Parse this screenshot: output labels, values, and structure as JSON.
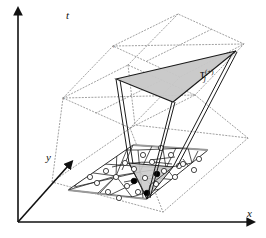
{
  "figure": {
    "background_color": "#ffffff",
    "line_color": "#1a1a1a",
    "dotted_color": "#8a8a8a",
    "shade_top_color": "#c9c9c9",
    "shade_bottom_color": "#cfcfcf"
  },
  "axes": {
    "t": {
      "label": "t",
      "x": 66,
      "y": 10
    },
    "y": {
      "label": "y",
      "x": 46,
      "y": 155
    },
    "x": {
      "label": "x",
      "x": 247,
      "y": 212
    }
  },
  "annotations": {
    "tau": {
      "symbol": "τ",
      "subscript": "j",
      "superscript": "(+)",
      "x": 200,
      "y": 72
    },
    "level_upper": {
      "label": "t",
      "x": 113,
      "y": 45
    },
    "level_lower": {
      "label": "t",
      "x": 63,
      "y": 97
    }
  },
  "mesh": {
    "open_node_count": 22,
    "filled_node_count": 3,
    "open_node_radius": 2.6,
    "filled_node_radius": 2.8,
    "open_nodes": [
      [
        106,
        171
      ],
      [
        125,
        163
      ],
      [
        143,
        155
      ],
      [
        161,
        148
      ],
      [
        179,
        166
      ],
      [
        97,
        183
      ],
      [
        116,
        177
      ],
      [
        134,
        169
      ],
      [
        152,
        162
      ],
      [
        171,
        155
      ],
      [
        108,
        192
      ],
      [
        127,
        186
      ],
      [
        145,
        178
      ],
      [
        164,
        171
      ],
      [
        183,
        164
      ],
      [
        119,
        198
      ],
      [
        138,
        192
      ],
      [
        156,
        184
      ],
      [
        175,
        177
      ],
      [
        194,
        170
      ],
      [
        90,
        177
      ],
      [
        199,
        159
      ]
    ],
    "filled_nodes": [
      [
        134,
        181
      ],
      [
        157,
        174
      ],
      [
        147,
        193
      ]
    ]
  },
  "planes": {
    "bottom_solid_label": "spatial mesh plane",
    "dotted_plane_count": 3
  }
}
